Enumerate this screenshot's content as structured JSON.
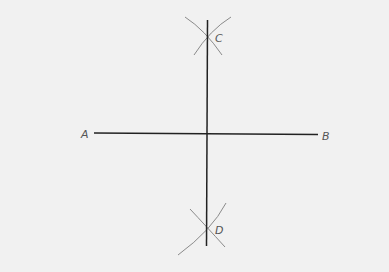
{
  "diagram": {
    "background": "#f1f1f1",
    "line_color": "#222222",
    "arc_color": "#8a8a8a",
    "points": [
      {
        "label": "A",
        "x": 94,
        "y": 133
      },
      {
        "label": "B",
        "x": 318,
        "y": 134
      },
      {
        "label": "C",
        "x": 207,
        "y": 38
      },
      {
        "label": "D",
        "x": 207,
        "y": 229
      }
    ],
    "segments": [
      {
        "name": "AB",
        "from": "A",
        "to": "B"
      },
      {
        "name": "CD",
        "from": "C",
        "to": "D"
      }
    ]
  },
  "labels": {
    "a": "A",
    "b": "B",
    "c": "C",
    "d": "D"
  }
}
